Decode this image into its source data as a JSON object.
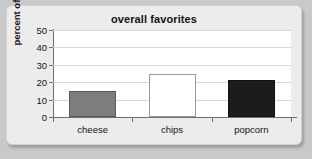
{
  "chart_data": {
    "type": "bar",
    "title": "overall favorites",
    "xlabel": "",
    "ylabel": "percent of people",
    "categories": [
      "cheese",
      "chips",
      "popcorn"
    ],
    "values": [
      15,
      25,
      21
    ],
    "series": [
      {
        "name": "percent of people",
        "values": [
          15,
          25,
          21
        ]
      }
    ],
    "ylim": [
      0,
      50
    ],
    "yticks": [
      0,
      10,
      20,
      30,
      40,
      50
    ],
    "ytick_labels": [
      "0",
      "10",
      "20",
      "30",
      "40",
      "50"
    ],
    "grid": true,
    "legend": false,
    "bar_styles": [
      {
        "category": "cheese",
        "fill": "#7d7d7d",
        "stroke": "#5a5a5a"
      },
      {
        "category": "chips",
        "fill": "#ffffff",
        "stroke": "#9a9a9a"
      },
      {
        "category": "popcorn",
        "fill": "#1c1c1c",
        "stroke": "#111111"
      }
    ]
  },
  "colors": {
    "page_background": "#c9c9c9",
    "card_background": "#ececec",
    "plot_background": "#ffffff",
    "gridline": "#d9d9d9",
    "axis": "#6e6e6e",
    "text": "#141414"
  }
}
